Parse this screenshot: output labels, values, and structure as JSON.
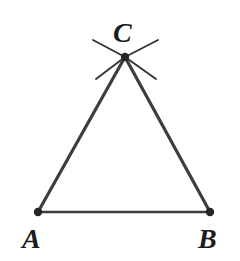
{
  "figure": {
    "kind": "geometric-construction",
    "background_color": "#ffffff",
    "stroke_color": "#3d3d3d",
    "arc_stroke_color": "#333333",
    "vertex_dot_color": "#262626",
    "label_color": "#1c1c1c",
    "canvas": {
      "width": 240,
      "height": 261
    },
    "vertices": [
      {
        "name": "C",
        "label": "C",
        "x": 125,
        "y": 57,
        "dot_radius": 4.2
      },
      {
        "name": "A",
        "label": "A",
        "x": 38,
        "y": 212,
        "dot_radius": 4.2
      },
      {
        "name": "B",
        "label": "B",
        "x": 210,
        "y": 212,
        "dot_radius": 4.2
      }
    ],
    "sides": [
      {
        "name": "side-CA",
        "from": "C",
        "to": "A",
        "x1": 125,
        "y1": 57,
        "x2": 38,
        "y2": 212,
        "width": 3.2
      },
      {
        "name": "side-CB",
        "from": "C",
        "to": "B",
        "x1": 125,
        "y1": 57,
        "x2": 210,
        "y2": 212,
        "width": 3.2
      },
      {
        "name": "side-AB",
        "from": "A",
        "to": "B",
        "x1": 38,
        "y1": 212,
        "x2": 210,
        "y2": 212,
        "width": 2.6
      }
    ],
    "construction_arcs": [
      {
        "name": "arc-upper-left",
        "x1": 93,
        "y1": 40,
        "x2": 125,
        "y2": 57,
        "width": 1.9
      },
      {
        "name": "arc-upper-right",
        "x1": 158,
        "y1": 40,
        "x2": 125,
        "y2": 57,
        "width": 1.9
      },
      {
        "name": "arc-lower-left",
        "x1": 96,
        "y1": 79,
        "x2": 125,
        "y2": 57,
        "width": 1.9
      },
      {
        "name": "arc-lower-right",
        "x1": 156,
        "y1": 79,
        "x2": 125,
        "y2": 57,
        "width": 1.9
      }
    ],
    "labels": {
      "C": "C",
      "A": "A",
      "B": "B"
    }
  }
}
